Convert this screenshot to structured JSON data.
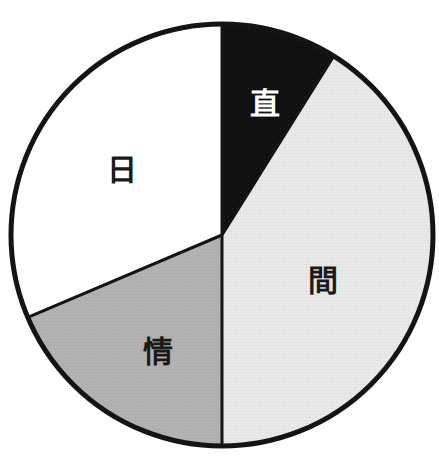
{
  "figure": {
    "name": "pie-chart-figure",
    "width": 439,
    "height": 460,
    "background": "#ffffff"
  },
  "chart_data": {
    "type": "pie",
    "title": "",
    "subtitle": "",
    "xlabel": "",
    "ylabel": "",
    "legend_position": "none",
    "grid": false,
    "labels_inside_slices": true,
    "start_angle_deg": 0,
    "direction": "clockwise",
    "categories": [
      "直",
      "間",
      "情",
      "日"
    ],
    "values": [
      8.9,
      41.1,
      18.6,
      31.4
    ],
    "unit": "percent",
    "slices": [
      {
        "label": "直",
        "value": 8.9,
        "start_deg": 0,
        "end_deg": 32,
        "fill": "#141414",
        "stroke": "#141414",
        "label_color": "#ffffff",
        "label_x": 265,
        "label_y": 103
      },
      {
        "label": "間",
        "value": 41.1,
        "start_deg": 32,
        "end_deg": 180,
        "fill": "#e9e9e9",
        "stroke": "#141414",
        "label_color": "#1a1a1a",
        "label_x": 323,
        "label_y": 280
      },
      {
        "label": "情",
        "value": 18.6,
        "start_deg": 180,
        "end_deg": 247,
        "fill": "#b2b2b2",
        "stroke": "#141414",
        "label_color": "#1a1a1a",
        "label_x": 158,
        "label_y": 351
      },
      {
        "label": "日",
        "value": 31.4,
        "start_deg": 247,
        "end_deg": 360,
        "fill": "#ffffff",
        "stroke": "#141414",
        "label_color": "#1a1a1a",
        "label_x": 122,
        "label_y": 169
      }
    ],
    "geometry": {
      "center_x": 222,
      "center_y": 235,
      "radius": 211,
      "outline_color": "#141414",
      "outline_width": 5,
      "divider_color": "#141414",
      "divider_width": 3
    }
  },
  "colors": {
    "ink": "#141414",
    "paper": "#ffffff",
    "light_gray": "#e9e9e9",
    "mid_gray": "#b2b2b2",
    "black_fill": "#141414"
  }
}
